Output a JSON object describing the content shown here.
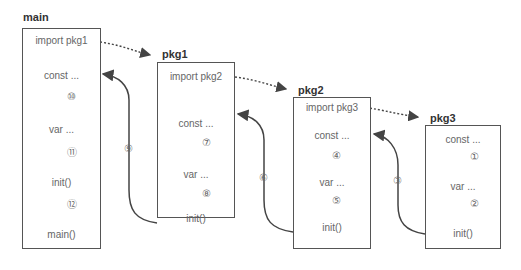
{
  "packages": [
    {
      "title": "main",
      "import": "import pkg1",
      "steps": [
        "const ...",
        "var ...",
        "init()",
        "main()"
      ],
      "step_numbers": [
        "⑩",
        "⑪",
        "⑫"
      ]
    },
    {
      "title": "pkg1",
      "import": "import pkg2",
      "steps": [
        "const ...",
        "var ...",
        "init()"
      ],
      "step_numbers": [
        "⑦",
        "⑧"
      ]
    },
    {
      "title": "pkg2",
      "import": "import pkg3",
      "steps": [
        "const ...",
        "var ...",
        "init()"
      ],
      "step_numbers": [
        "④",
        "⑤"
      ]
    },
    {
      "title": "pkg3",
      "steps": [
        "const ...",
        "var ...",
        "init()"
      ],
      "step_numbers": [
        "①",
        "②"
      ]
    }
  ],
  "return_arrows": [
    {
      "from": "pkg1",
      "to": "main",
      "label": "⑨"
    },
    {
      "from": "pkg2",
      "to": "pkg1",
      "label": "⑥"
    },
    {
      "from": "pkg3",
      "to": "pkg2",
      "label": "③"
    }
  ],
  "colors": {
    "line": "#444444",
    "text": "#666666"
  }
}
